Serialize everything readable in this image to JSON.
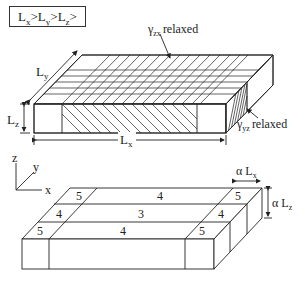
{
  "condition": {
    "parts": [
      {
        "base": "L",
        "sub": "x"
      },
      {
        "sep": ">"
      },
      {
        "base": "L",
        "sub": "y"
      },
      {
        "sep": ">"
      },
      {
        "base": "L",
        "sub": "z"
      },
      {
        "sep": ">"
      }
    ],
    "text": "Lx>Ly>Lz>"
  },
  "top_box": {
    "labels": {
      "gamma_zx": "γ",
      "gamma_zx_sub": "zx",
      "gamma_zx_word": "relaxed",
      "gamma_yz": "γ",
      "gamma_yz_sub": "yz",
      "gamma_yz_word": "relaxed",
      "Lx": "L",
      "Lx_sub": "x",
      "Ly": "L",
      "Ly_sub": "y",
      "Lz": "L",
      "Lz_sub": "z"
    }
  },
  "axes": {
    "z": "z",
    "y": "y",
    "x": "x"
  },
  "bottom_box": {
    "regions": {
      "back_row": [
        "5",
        "4",
        "5"
      ],
      "middle_row": [
        "4",
        "3",
        "4"
      ],
      "front_row": [
        "5",
        "4",
        "5"
      ]
    },
    "labels": {
      "alpha_Lx": "α L",
      "alpha_Lx_sub": "x",
      "alpha_Lz": "α L",
      "alpha_Lz_sub": "z"
    }
  }
}
